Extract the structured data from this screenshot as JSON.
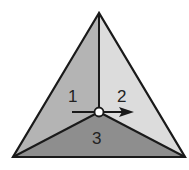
{
  "diagram": {
    "regions": [
      {
        "id": "1",
        "label": "1",
        "color": "#b4b4b4"
      },
      {
        "id": "2",
        "label": "2",
        "color": "#dcdcdc"
      },
      {
        "id": "3",
        "label": "3",
        "color": "#8e8e8e"
      }
    ],
    "outline_color": "#1a1a1a",
    "center_marker": "open-circle",
    "arrow_direction": "right"
  }
}
